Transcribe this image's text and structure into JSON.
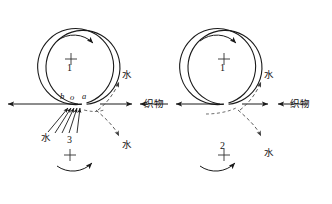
{
  "figure": {
    "stroke_color": "#1a1a1a",
    "dash_color": "#555555",
    "background": "#ffffff"
  },
  "diagrams": [
    {
      "id": "left",
      "name": "left-nip-diagram",
      "top_roller": {
        "number": "1",
        "crosshair": "+",
        "rotation": "clockwise"
      },
      "bottom_roller": {
        "number": "3",
        "crosshair": "+",
        "rotation": "counter-clockwise"
      },
      "nip_points": [
        {
          "label": "b"
        },
        {
          "label": "o"
        },
        {
          "label": "a"
        }
      ],
      "fabric_label": "织物",
      "water_labels": [
        {
          "label": "水",
          "position": "upper-right"
        },
        {
          "label": "水",
          "position": "lower-left"
        },
        {
          "label": "水",
          "position": "lower-right"
        }
      ]
    },
    {
      "id": "right",
      "name": "right-nip-diagram",
      "top_roller": {
        "number": "1",
        "crosshair": "+",
        "rotation": "clockwise"
      },
      "bottom_roller": {
        "number": "2",
        "crosshair": "+",
        "rotation": "counter-clockwise"
      },
      "nip_points": [],
      "fabric_label": "织物",
      "water_labels": [
        {
          "label": "水",
          "position": "upper-right"
        },
        {
          "label": "水",
          "position": "lower-right"
        }
      ]
    }
  ]
}
